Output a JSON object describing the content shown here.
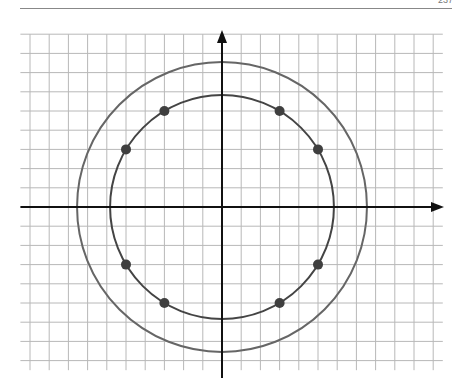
{
  "page": {
    "page_number": "237"
  },
  "figure": {
    "type": "coordinate-grid-diagram",
    "grid": {
      "cell_px": 19.2,
      "x_min_units": -10.5,
      "x_max_units": 11.5,
      "y_max_units": 9,
      "y_min_units": -8.5,
      "color": "#b8b8b8"
    },
    "origin_px": [
      222,
      207
    ],
    "axes": {
      "color": "#111111",
      "x_arrow": true,
      "y_arrow": true
    },
    "circles": [
      {
        "name": "inner-circle",
        "radius_units": 5.83,
        "color": "#444444"
      },
      {
        "name": "outer-circle",
        "radius_units": 7.55,
        "color": "#666666"
      }
    ],
    "points": [
      {
        "x": 3,
        "y": 5
      },
      {
        "x": 5,
        "y": 3
      },
      {
        "x": 5,
        "y": -3
      },
      {
        "x": 3,
        "y": -5
      },
      {
        "x": -3,
        "y": -5
      },
      {
        "x": -5,
        "y": -3
      },
      {
        "x": -5,
        "y": 3
      },
      {
        "x": -3,
        "y": 5
      }
    ],
    "point_color": "#3f3f3f"
  }
}
